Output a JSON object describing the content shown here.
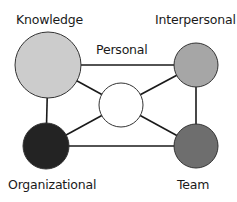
{
  "diagram": {
    "nodes": [
      {
        "id": "knowledge",
        "label": "Knowledge",
        "fill": "#cccccc"
      },
      {
        "id": "interpersonal",
        "label": "Interpersonal",
        "fill": "#a6a6a6"
      },
      {
        "id": "personal",
        "label": "Personal",
        "fill": "#ffffff"
      },
      {
        "id": "organizational",
        "label": "Organizational",
        "fill": "#232323"
      },
      {
        "id": "team",
        "label": "Team",
        "fill": "#6e6e6e"
      }
    ],
    "edges": [
      [
        "knowledge",
        "interpersonal"
      ],
      [
        "knowledge",
        "organizational"
      ],
      [
        "knowledge",
        "personal"
      ],
      [
        "interpersonal",
        "team"
      ],
      [
        "interpersonal",
        "personal"
      ],
      [
        "organizational",
        "team"
      ],
      [
        "organizational",
        "personal"
      ],
      [
        "team",
        "personal"
      ]
    ]
  }
}
